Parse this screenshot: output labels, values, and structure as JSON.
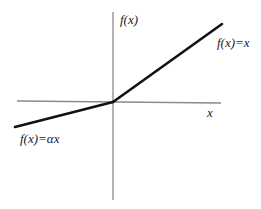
{
  "diagram": {
    "labels": {
      "y_axis": "f(x)",
      "x_axis": "x",
      "positive_branch": "f(x)=x",
      "negative_branch": "f(x)=αx"
    },
    "colors": {
      "axis": "#8a8a8a",
      "curve": "#111111",
      "text": "#1a1a1a",
      "background": "#ffffff"
    },
    "geometry": {
      "origin": [
        113,
        102
      ],
      "x_axis": {
        "x1": 17,
        "y1": 101,
        "x2": 221,
        "y2": 103
      },
      "y_axis": {
        "x1": 113,
        "y1": 12,
        "x2": 113,
        "y2": 200
      },
      "negative_segment": {
        "x1": 15,
        "y1": 127,
        "x2": 113,
        "y2": 102
      },
      "positive_segment": {
        "x1": 113,
        "y1": 102,
        "x2": 222,
        "y2": 24
      }
    }
  }
}
